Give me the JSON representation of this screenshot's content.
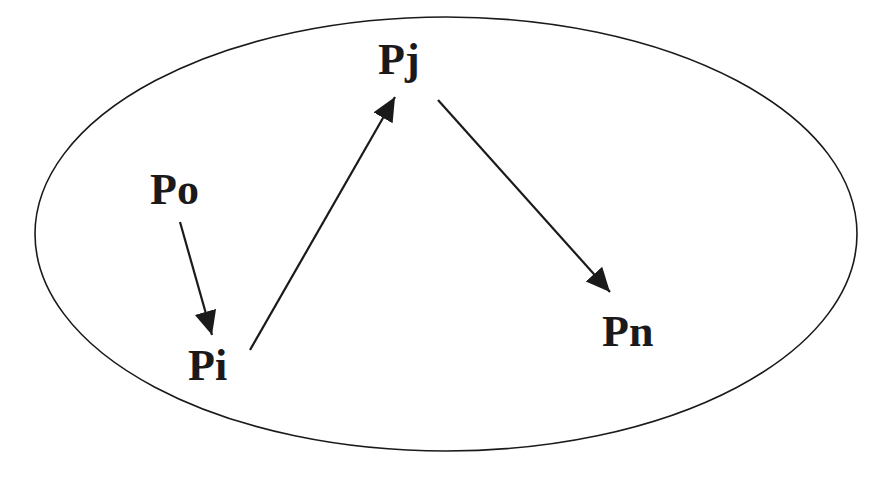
{
  "diagram": {
    "nodes": [
      {
        "id": "po",
        "label": "Po",
        "x": 150,
        "y": 168
      },
      {
        "id": "pi",
        "label": "Pi",
        "x": 188,
        "y": 344
      },
      {
        "id": "pj",
        "label": "Pj",
        "x": 378,
        "y": 38
      },
      {
        "id": "pn",
        "label": "Pn",
        "x": 602,
        "y": 310
      }
    ],
    "edges": [
      {
        "from": "Po",
        "to": "Pi"
      },
      {
        "from": "Pi",
        "to": "Pj"
      },
      {
        "from": "Pj",
        "to": "Pn"
      }
    ],
    "container": {
      "shape": "ellipse",
      "cx": 446,
      "cy": 234,
      "rx": 411,
      "ry": 217
    },
    "colors": {
      "stroke": "#1a1a1a",
      "background": "#ffffff"
    }
  }
}
